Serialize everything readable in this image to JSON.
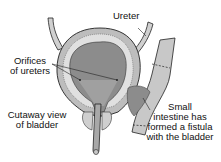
{
  "labels": {
    "ureter": "Ureter",
    "orifices_line1": "Orifices",
    "orifices_line2": "of ureters",
    "cutaway_line1": "Cutaway view",
    "cutaway_line2": "of bladder",
    "intestine_line1": "Small",
    "intestine_line2": "intestine has",
    "intestine_line3": "formed a fistula",
    "intestine_line4": "with the bladder"
  },
  "colors": {
    "lumen": "#8c8c8c",
    "wall": "#d8d8d8",
    "outer": "#bdbdbd",
    "intestine": "#c8c8c8",
    "line": "#222222"
  }
}
